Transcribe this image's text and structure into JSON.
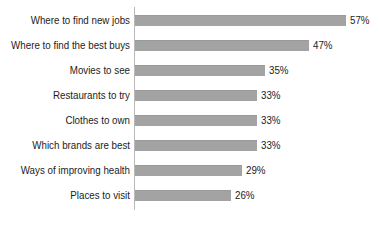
{
  "chart_data": {
    "type": "bar",
    "orientation": "horizontal",
    "title": "",
    "subtitle": "",
    "xlabel": "",
    "ylabel": "",
    "grid": false,
    "legend": null,
    "axis": {
      "category_axis": "vertical-line-at-left-of-bars",
      "value_axis_visible": false,
      "xlim": [
        0,
        65
      ]
    },
    "categories": [
      "Where to find new jobs",
      "Where to find the best buys",
      "Movies to see",
      "Restaurants to try",
      "Clothes to own",
      "Which brands are best",
      "Ways of improving health",
      "Places to visit"
    ],
    "values": [
      57,
      47,
      35,
      33,
      33,
      33,
      29,
      26
    ],
    "value_labels": [
      "57%",
      "47%",
      "35%",
      "33%",
      "33%",
      "33%",
      "29%",
      "26%"
    ],
    "colors": {
      "bar": "#a3a3a3",
      "bar_edge": "#9a9a9a",
      "axis_line": "#b9b9b9",
      "text": "#1c1c1c",
      "background": "#ffffff"
    }
  },
  "bars": [
    {
      "label": "Where to find new jobs",
      "value": 57,
      "value_label": "57%"
    },
    {
      "label": "Where to find the best buys",
      "value": 47,
      "value_label": "47%"
    },
    {
      "label": "Movies to see",
      "value": 35,
      "value_label": "35%"
    },
    {
      "label": "Restaurants to try",
      "value": 33,
      "value_label": "33%"
    },
    {
      "label": "Clothes to own",
      "value": 33,
      "value_label": "33%"
    },
    {
      "label": "Which brands are best",
      "value": 33,
      "value_label": "33%"
    },
    {
      "label": "Ways of improving health",
      "value": 29,
      "value_label": "29%"
    },
    {
      "label": "Places to visit",
      "value": 26,
      "value_label": "26%"
    }
  ]
}
